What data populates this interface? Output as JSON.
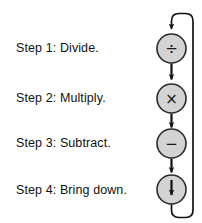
{
  "diagram": {
    "background_color": "#ffffff",
    "node_fill_color": "#d3d3d3",
    "node_stroke_color": "#2b2b2b",
    "arrow_color": "#111111",
    "text_color": "#111111",
    "steps": [
      {
        "label": "Step 1: Divide.",
        "operation_name": "divide",
        "symbol": "÷"
      },
      {
        "label": "Step 2: Multiply.",
        "operation_name": "multiply",
        "symbol": "×"
      },
      {
        "label": "Step 3: Subtract.",
        "operation_name": "subtract",
        "symbol": "−"
      },
      {
        "label": "Step 4: Bring down.",
        "operation_name": "bring-down",
        "symbol": "↓"
      }
    ]
  }
}
